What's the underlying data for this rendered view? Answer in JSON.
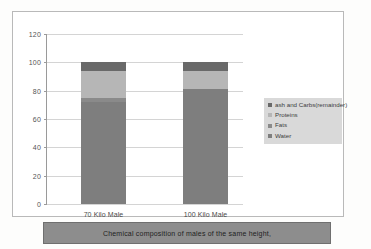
{
  "caption": "Chemical composition of males of the same height,",
  "colors": {
    "water": "#7e7e7e",
    "fats": "#8a8a8a",
    "proteins": "#b6b6b6",
    "ash": "#696969",
    "legend_background": "#d9d9d9",
    "caption_background": "#8d8d8d",
    "gridline": "#d4d4d4"
  },
  "chart_data": {
    "type": "bar",
    "subtype": "stacked",
    "title": "",
    "xlabel": "",
    "ylabel": "",
    "ylim": [
      0,
      120
    ],
    "yticks": [
      0,
      20,
      40,
      60,
      80,
      100,
      120
    ],
    "ytick_labels": [
      "0",
      "20",
      "40",
      "60",
      "80",
      "100",
      "120"
    ],
    "grid": true,
    "legend_position": "right",
    "categories": [
      "70 Kilo Male",
      "100 Kilo Male"
    ],
    "series": [
      {
        "name": "Water",
        "values": [
          72,
          81
        ]
      },
      {
        "name": "Fats",
        "values": [
          3,
          0
        ]
      },
      {
        "name": "Proteins",
        "values": [
          19,
          13
        ]
      },
      {
        "name": "ash and Carbs(remainder)",
        "values": [
          6,
          6
        ]
      }
    ],
    "totals": [
      100,
      100
    ]
  }
}
